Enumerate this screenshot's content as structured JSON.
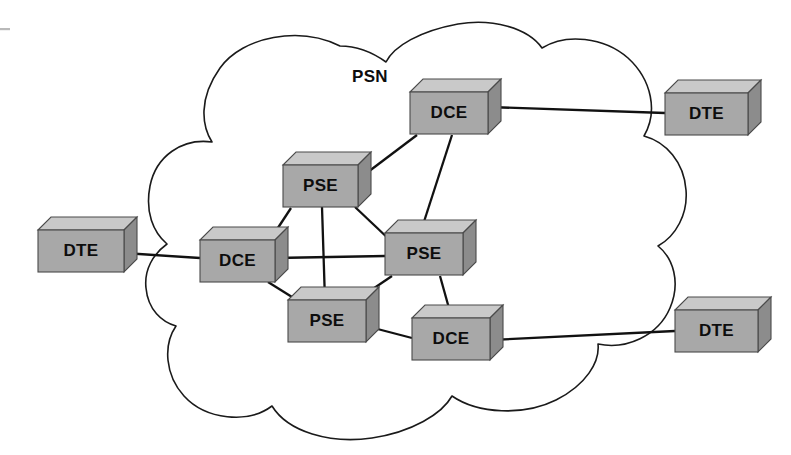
{
  "diagram": {
    "cloud_label": "PSN",
    "cloud_label_x": 370,
    "cloud_label_y": 78,
    "colors": {
      "node_front": "#a8a8a8",
      "node_top": "#c9c9c9",
      "node_side": "#8c8c8c",
      "node_stroke": "#4a4a4a",
      "link": "#111111",
      "cloud_stroke": "#1a1a1a",
      "background": "#ffffff",
      "label_text": "#0d0d0d"
    },
    "cloud_path": "M 340 46 C 300 26, 243 36, 220 68 C 198 99, 202 126, 212 142 C 182 138, 156 156, 150 186 C 145 212, 153 232, 167 244 C 153 254, 144 270, 146 288 C 148 310, 162 322, 176 326 C 163 345, 165 375, 184 396 C 206 420, 248 424, 272 406 C 288 432, 330 444, 372 438 C 412 432, 442 414, 452 396 C 478 414, 524 416, 556 400 C 586 385, 600 362, 598 344 C 626 350, 658 336, 670 308 C 681 282, 673 258, 658 246 C 676 236, 688 214, 686 190 C 684 162, 666 142, 644 136 C 658 112, 652 80, 628 58 C 604 37, 566 33, 542 48 C 528 28, 492 18, 458 24 C 420 31, 394 46, 386 62 C 372 52, 356 46, 340 46 Z",
    "nodes": [
      {
        "id": "dte-left",
        "label": "DTE",
        "x": 38,
        "y": 230,
        "w": 86,
        "h": 42,
        "depth": 13
      },
      {
        "id": "dce-left",
        "label": "DCE",
        "x": 200,
        "y": 240,
        "w": 75,
        "h": 42,
        "depth": 13
      },
      {
        "id": "pse-top",
        "label": "PSE",
        "x": 283,
        "y": 165,
        "w": 75,
        "h": 42,
        "depth": 13
      },
      {
        "id": "pse-right",
        "label": "PSE",
        "x": 385,
        "y": 233,
        "w": 78,
        "h": 42,
        "depth": 13
      },
      {
        "id": "pse-bottom",
        "label": "PSE",
        "x": 288,
        "y": 300,
        "w": 78,
        "h": 42,
        "depth": 13
      },
      {
        "id": "dce-top",
        "label": "DCE",
        "x": 410,
        "y": 92,
        "w": 78,
        "h": 42,
        "depth": 13
      },
      {
        "id": "dce-bottom",
        "label": "DCE",
        "x": 412,
        "y": 318,
        "w": 78,
        "h": 42,
        "depth": 13
      },
      {
        "id": "dte-top-right",
        "label": "DTE",
        "x": 665,
        "y": 93,
        "w": 83,
        "h": 42,
        "depth": 13
      },
      {
        "id": "dte-bottom-right",
        "label": "DTE",
        "x": 675,
        "y": 310,
        "w": 83,
        "h": 42,
        "depth": 13
      }
    ],
    "links": [
      {
        "id": "link-dte-left-dce-left",
        "from": "dte-left",
        "to": "dce-left",
        "x1": 124,
        "y1": 253,
        "x2": 200,
        "y2": 258
      },
      {
        "id": "link-dce-left-pse-top",
        "from": "dce-left",
        "to": "pse-top",
        "x1": 268,
        "y1": 243,
        "x2": 291,
        "y2": 208
      },
      {
        "id": "link-dce-left-pse-right",
        "from": "dce-left",
        "to": "pse-right",
        "x1": 275,
        "y1": 258,
        "x2": 385,
        "y2": 256
      },
      {
        "id": "link-dce-left-pse-bottom",
        "from": "dce-left",
        "to": "pse-bottom",
        "x1": 268,
        "y1": 282,
        "x2": 300,
        "y2": 302
      },
      {
        "id": "link-pse-top-pse-bottom",
        "from": "pse-top",
        "to": "pse-bottom",
        "x1": 322,
        "y1": 207,
        "x2": 325,
        "y2": 301
      },
      {
        "id": "link-pse-top-pse-right",
        "from": "pse-top",
        "to": "pse-right",
        "x1": 355,
        "y1": 207,
        "x2": 392,
        "y2": 242
      },
      {
        "id": "link-pse-top-dce-top",
        "from": "pse-top",
        "to": "dce-top",
        "x1": 364,
        "y1": 175,
        "x2": 417,
        "y2": 135
      },
      {
        "id": "link-pse-bottom-pse-right",
        "from": "pse-bottom",
        "to": "pse-right",
        "x1": 355,
        "y1": 301,
        "x2": 392,
        "y2": 276
      },
      {
        "id": "link-pse-right-dce-top",
        "from": "pse-right",
        "to": "dce-top",
        "x1": 420,
        "y1": 234,
        "x2": 452,
        "y2": 135
      },
      {
        "id": "link-pse-right-dce-bottom",
        "from": "pse-right",
        "to": "dce-bottom",
        "x1": 440,
        "y1": 276,
        "x2": 452,
        "y2": 319
      },
      {
        "id": "link-pse-bottom-dce-bottom",
        "from": "pse-bottom",
        "to": "dce-bottom",
        "x1": 366,
        "y1": 326,
        "x2": 412,
        "y2": 338
      },
      {
        "id": "link-dce-top-dte-top-right",
        "from": "dce-top",
        "to": "dte-top-right",
        "x1": 488,
        "y1": 107,
        "x2": 665,
        "y2": 113
      },
      {
        "id": "link-dce-bottom-dte-bottom-right",
        "from": "dce-bottom",
        "to": "dte-bottom-right",
        "x1": 490,
        "y1": 340,
        "x2": 675,
        "y2": 331
      }
    ]
  }
}
